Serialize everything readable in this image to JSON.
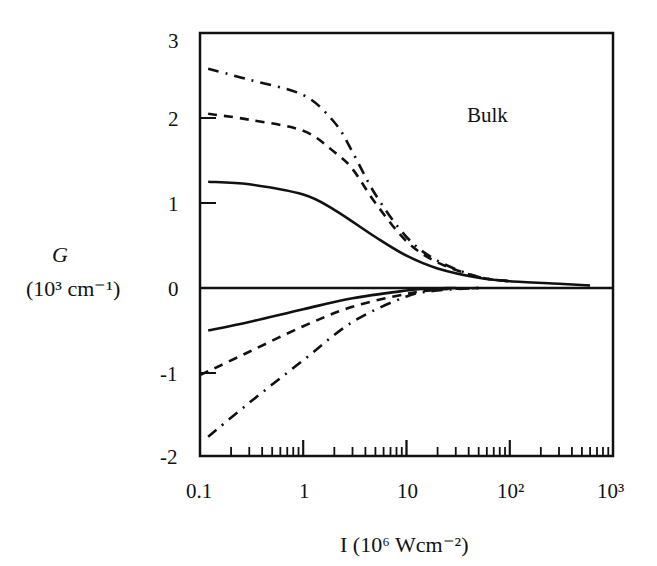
{
  "chart_data": {
    "type": "line",
    "title": "",
    "annotation": "Bulk",
    "xlabel": "I (10^6 Wcm^-2)",
    "ylabel": "G (10^3 cm^-1)",
    "xscale": "log",
    "xlim": [
      0.1,
      1000
    ],
    "ylim": [
      -2,
      3
    ],
    "grid": false,
    "legend": "none",
    "x_tick_labels": [
      "0.1",
      "1",
      "10",
      "10^2",
      "10^3"
    ],
    "y_tick_labels": [
      "3",
      "2",
      "1",
      "0",
      "-1",
      "-2"
    ],
    "series": [
      {
        "name": "solid-positive",
        "style": "solid",
        "x": [
          0.12,
          0.3,
          1,
          2,
          5,
          10,
          20,
          50,
          100,
          300,
          600
        ],
        "y": [
          1.25,
          1.22,
          1.1,
          0.92,
          0.6,
          0.38,
          0.23,
          0.12,
          0.08,
          0.05,
          0.03
        ]
      },
      {
        "name": "dashed-positive",
        "style": "dashed",
        "x": [
          0.12,
          0.3,
          1,
          2,
          3,
          5,
          10,
          20,
          50,
          100
        ],
        "y": [
          2.05,
          1.98,
          1.85,
          1.6,
          1.4,
          1.0,
          0.55,
          0.3,
          0.13,
          0.08
        ]
      },
      {
        "name": "dashdot-positive",
        "style": "dashdot",
        "x": [
          0.12,
          0.3,
          1,
          2,
          3,
          5,
          10,
          20,
          50,
          100
        ],
        "y": [
          2.58,
          2.45,
          2.27,
          1.95,
          1.6,
          1.1,
          0.6,
          0.32,
          0.13,
          0.08
        ]
      },
      {
        "name": "solid-negative",
        "style": "solid",
        "x": [
          0.12,
          0.3,
          1,
          3,
          10,
          15,
          30
        ],
        "y": [
          -0.5,
          -0.4,
          -0.25,
          -0.12,
          -0.03,
          -0.01,
          0.0
        ]
      },
      {
        "name": "dashed-negative",
        "style": "dashed",
        "x": [
          0.1,
          0.12,
          0.3,
          1,
          3,
          10,
          20,
          50
        ],
        "y": [
          -1.02,
          -0.98,
          -0.75,
          -0.45,
          -0.22,
          -0.07,
          -0.02,
          0.0
        ]
      },
      {
        "name": "dashdot-negative",
        "style": "dashdot",
        "x": [
          0.12,
          0.3,
          1,
          3,
          10,
          20,
          50
        ],
        "y": [
          -1.75,
          -1.35,
          -0.85,
          -0.4,
          -0.1,
          -0.03,
          0.0
        ]
      }
    ]
  },
  "labels": {
    "annotation": "Bulk",
    "ylabel_main": "G",
    "ylabel_unit": "(10³ cm⁻¹)",
    "xlabel": "I (10⁶ Wcm⁻²)",
    "xticks": [
      "0.1",
      "1",
      "10",
      "10²",
      "10³"
    ],
    "yticks": [
      "3",
      "2",
      "1",
      "0",
      "-1",
      "-2"
    ]
  }
}
